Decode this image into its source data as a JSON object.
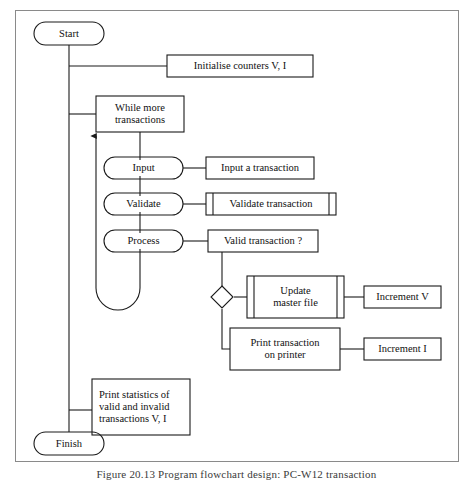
{
  "figure": {
    "caption": "Figure 20.13  Program flowchart design: PC-W12 transaction"
  },
  "nodes": {
    "start": {
      "label": "Start",
      "shape": "terminator-oval"
    },
    "initialise": {
      "label": "Initialise counters V, I",
      "shape": "rectangle"
    },
    "while": {
      "label": "While more\ntransactions",
      "shape": "rectangle"
    },
    "input_step": {
      "label": "Input",
      "shape": "oval"
    },
    "input_action": {
      "label": "Input a transaction",
      "shape": "rectangle"
    },
    "validate_step": {
      "label": "Validate",
      "shape": "oval"
    },
    "validate_action": {
      "label": "Validate transaction",
      "shape": "predefined-process"
    },
    "process_step": {
      "label": "Process",
      "shape": "oval"
    },
    "valid_question": {
      "label": "Valid transaction ?",
      "shape": "rectangle"
    },
    "decision": {
      "label": "",
      "shape": "diamond"
    },
    "update_master": {
      "label": "Update\nmaster file",
      "shape": "predefined-process"
    },
    "increment_v": {
      "label": "Increment V",
      "shape": "rectangle"
    },
    "print_transaction": {
      "label": "Print transaction\non printer",
      "shape": "rectangle"
    },
    "increment_i": {
      "label": "Increment I",
      "shape": "rectangle"
    },
    "print_statistics": {
      "label": "Print statistics of\nvalid and invalid\ntransactions V, I",
      "shape": "rectangle"
    },
    "finish": {
      "label": "Finish",
      "shape": "terminator-oval"
    }
  },
  "colors": {
    "stroke": "#1a1a1a",
    "frame": "#8a8a8a",
    "background": "#ffffff",
    "text": "#111111"
  }
}
